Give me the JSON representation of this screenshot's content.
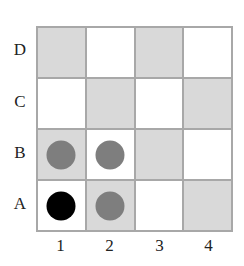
{
  "rows": [
    "D",
    "C",
    "B",
    "A"
  ],
  "columns": [
    "1",
    "2",
    "3",
    "4"
  ],
  "colors": {
    "gray_cell": "#d9d9d9",
    "white_cell": "#ffffff",
    "border": "#a8a8a8",
    "gray_dot": "#7e7e7e",
    "black_dot": "#000000"
  },
  "cells": [
    [
      "gray",
      "white",
      "gray",
      "white"
    ],
    [
      "white",
      "gray",
      "white",
      "gray"
    ],
    [
      "gray",
      "white",
      "gray",
      "white"
    ],
    [
      "white",
      "gray",
      "white",
      "gray"
    ]
  ],
  "pieces": [
    {
      "row": "B",
      "col": "1",
      "color": "gray"
    },
    {
      "row": "B",
      "col": "2",
      "color": "gray"
    },
    {
      "row": "A",
      "col": "1",
      "color": "black"
    },
    {
      "row": "A",
      "col": "2",
      "color": "gray"
    }
  ]
}
